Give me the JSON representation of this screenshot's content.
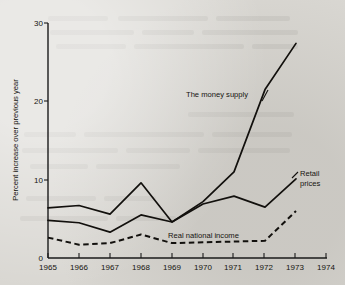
{
  "chart_data": {
    "type": "line",
    "title": "",
    "xlabel": "",
    "ylabel": "Percent increase over previous year",
    "x": [
      1965,
      1966,
      1967,
      1968,
      1969,
      1970,
      1971,
      1972,
      1973
    ],
    "xlim": [
      1965,
      1974
    ],
    "ylim": [
      0,
      30
    ],
    "xtick_labels": [
      "1965",
      "1966",
      "1967",
      "1968",
      "1969",
      "1970",
      "1971",
      "1972",
      "1973",
      "1974"
    ],
    "ytick_labels": [
      "0",
      "10",
      "20",
      "30"
    ],
    "yticks": [
      0,
      10,
      20,
      30
    ],
    "grid": false,
    "legend_position": "inline-annotations",
    "series": [
      {
        "name": "The money supply",
        "style": "solid",
        "label_x": 1970.4,
        "label_y": 22.6,
        "values": [
          6.4,
          6.7,
          5.6,
          9.6,
          4.6,
          7.2,
          11.0,
          21.5,
          27.4
        ]
      },
      {
        "name": "Retail prices",
        "style": "solid",
        "label_x": 1973.6,
        "label_y": 11.1,
        "values": [
          4.8,
          4.5,
          3.3,
          5.5,
          4.6,
          6.9,
          7.9,
          6.5,
          10.1
        ]
      },
      {
        "name": "Real national income",
        "style": "dashed",
        "label_x": 1969.8,
        "label_y": 3.5,
        "values": [
          2.6,
          1.7,
          1.9,
          3.0,
          1.9,
          2.0,
          2.1,
          2.2,
          6.0
        ]
      }
    ],
    "annotations": [
      {
        "text": "The money supply",
        "lines": [
          "The money supply"
        ]
      },
      {
        "text": "Retail prices",
        "lines": [
          "Retail",
          "prices"
        ]
      },
      {
        "text": "Real national income",
        "lines": [
          "Real national income"
        ]
      }
    ],
    "colors": {
      "background": "#d9d7d2",
      "ink": "#12100d",
      "axis": "#1a1a1a"
    }
  }
}
